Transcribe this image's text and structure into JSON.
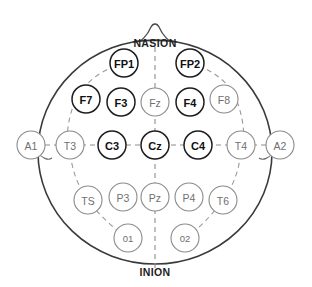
{
  "diagram": {
    "background_color": "#ffffff",
    "head": {
      "center_x": 155,
      "center_y": 152,
      "radius_x": 117,
      "radius_y": 112,
      "stroke_color": "#3a3a3a"
    },
    "landmarks": [
      {
        "id": "nasion",
        "label": "NASION",
        "x": 155,
        "y": 43
      },
      {
        "id": "inion",
        "label": "INION",
        "x": 155,
        "y": 272
      }
    ],
    "nose": {
      "x": 155,
      "y": 22,
      "width": 40,
      "height": 20
    },
    "electrodes": [
      {
        "id": "fp1",
        "label": "FP1",
        "x": 124,
        "y": 63,
        "r": 14,
        "weight": "bold",
        "size": "normal"
      },
      {
        "id": "fp2",
        "label": "FP2",
        "x": 190,
        "y": 63,
        "r": 14,
        "weight": "bold",
        "size": "normal"
      },
      {
        "id": "f7",
        "label": "F7",
        "x": 86,
        "y": 99,
        "r": 14,
        "weight": "bold",
        "size": "normal"
      },
      {
        "id": "f3",
        "label": "F3",
        "x": 121,
        "y": 102,
        "r": 14,
        "weight": "bold",
        "size": "normal"
      },
      {
        "id": "fz",
        "label": "Fz",
        "x": 155,
        "y": 102,
        "r": 14,
        "weight": "light",
        "size": "normal"
      },
      {
        "id": "f4",
        "label": "F4",
        "x": 190,
        "y": 102,
        "r": 14,
        "weight": "bold",
        "size": "normal"
      },
      {
        "id": "f8",
        "label": "F8",
        "x": 224,
        "y": 99,
        "r": 14,
        "weight": "light",
        "size": "normal"
      },
      {
        "id": "a1",
        "label": "A1",
        "x": 31,
        "y": 145,
        "r": 14,
        "weight": "light",
        "size": "normal"
      },
      {
        "id": "t3",
        "label": "T3",
        "x": 70,
        "y": 145,
        "r": 14,
        "weight": "light",
        "size": "normal"
      },
      {
        "id": "c3",
        "label": "C3",
        "x": 112,
        "y": 145,
        "r": 14,
        "weight": "bold",
        "size": "normal"
      },
      {
        "id": "cz",
        "label": "Cz",
        "x": 155,
        "y": 145,
        "r": 14,
        "weight": "bold",
        "size": "normal"
      },
      {
        "id": "c4",
        "label": "C4",
        "x": 198,
        "y": 145,
        "r": 14,
        "weight": "bold",
        "size": "normal"
      },
      {
        "id": "t4",
        "label": "T4",
        "x": 241,
        "y": 145,
        "r": 14,
        "weight": "light",
        "size": "normal"
      },
      {
        "id": "a2",
        "label": "A2",
        "x": 280,
        "y": 145,
        "r": 14,
        "weight": "light",
        "size": "normal"
      },
      {
        "id": "t5",
        "label": "TS",
        "x": 88,
        "y": 200,
        "r": 14,
        "weight": "light",
        "size": "normal"
      },
      {
        "id": "p3",
        "label": "P3",
        "x": 123,
        "y": 197,
        "r": 14,
        "weight": "light",
        "size": "normal"
      },
      {
        "id": "pz",
        "label": "Pz",
        "x": 155,
        "y": 197,
        "r": 14,
        "weight": "light",
        "size": "normal"
      },
      {
        "id": "p4",
        "label": "P4",
        "x": 189,
        "y": 197,
        "r": 14,
        "weight": "light",
        "size": "normal"
      },
      {
        "id": "t6",
        "label": "T6",
        "x": 223,
        "y": 200,
        "r": 14,
        "weight": "light",
        "size": "normal"
      },
      {
        "id": "o1",
        "label": "01",
        "x": 128,
        "y": 238,
        "r": 14,
        "weight": "light",
        "size": "small"
      },
      {
        "id": "o2",
        "label": "02",
        "x": 185,
        "y": 238,
        "r": 14,
        "weight": "light",
        "size": "small"
      }
    ],
    "guide_lines": {
      "midline_vertical": {
        "x": 155,
        "y1": 47,
        "y2": 268
      },
      "coronal_horizontal": {
        "y": 145,
        "x1": 45,
        "x2": 266
      }
    },
    "guide_arcs": [
      {
        "id": "left-perimeter-arc",
        "path": "M 124 63 C 100 70 82 84 74 104 C 66 124 66 146 70 145"
      },
      {
        "id": "right-perimeter-arc",
        "path": "M 190 63 C 214 70 232 84 238 104 C 245 124 245 146 241 145"
      },
      {
        "id": "left-lower-arc",
        "path": "M 70 145 C 70 164 76 184 88 200 C 100 216 114 229 128 238"
      },
      {
        "id": "right-lower-arc",
        "path": "M 241 145 C 241 164 235 184 223 200 C 211 216 199 229 185 238"
      }
    ]
  }
}
